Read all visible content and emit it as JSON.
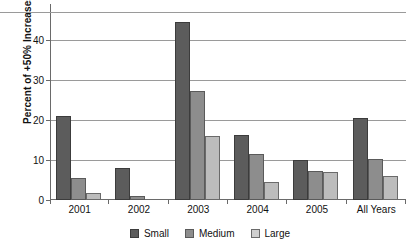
{
  "chart_data": {
    "type": "bar",
    "title": "",
    "xlabel": "",
    "ylabel": "Percent of +50% Increases",
    "categories": [
      "2001",
      "2002",
      "2003",
      "2004",
      "2005",
      "All Years"
    ],
    "series": [
      {
        "name": "Small",
        "color": "#5c5c5c",
        "values": [
          21.0,
          8.0,
          44.6,
          16.3,
          10.0,
          20.5
        ]
      },
      {
        "name": "Medium",
        "color": "#8d8d8d",
        "values": [
          5.5,
          1.0,
          27.3,
          11.5,
          7.3,
          10.3
        ]
      },
      {
        "name": "Large",
        "color": "#bcbcbc",
        "values": [
          1.8,
          0.0,
          16.0,
          4.5,
          7.0,
          6.0
        ]
      }
    ],
    "ylim": [
      0,
      48
    ],
    "yticks": [
      0,
      10,
      20,
      30,
      40
    ],
    "ytick_labels": [
      "0",
      "10",
      "20",
      "30",
      "40"
    ],
    "grid": true,
    "legend_position": "bottom",
    "legend_entries": [
      "Small",
      "Medium",
      "Large"
    ]
  },
  "legend": {
    "items": [
      {
        "label": "Small"
      },
      {
        "label": "Medium"
      },
      {
        "label": "Large"
      }
    ]
  }
}
